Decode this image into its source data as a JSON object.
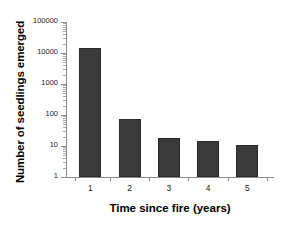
{
  "chart_data": {
    "type": "bar",
    "title": "",
    "xlabel": "Time since fire (years)",
    "ylabel": "Number of seedlings emerged",
    "categories": [
      "1",
      "2",
      "3",
      "4",
      "5"
    ],
    "values": [
      14000,
      75,
      18,
      14,
      11
    ],
    "yscale": "log",
    "ylim": [
      1,
      100000
    ],
    "yticks": [
      "1",
      "10",
      "100",
      "1000",
      "10000",
      "100000"
    ],
    "ytick_values": [
      1,
      10,
      100,
      1000,
      10000,
      100000
    ],
    "grid": false,
    "legend": null,
    "bar_color": "#3a3a3a",
    "axis_color": "#8a8a8a",
    "text_color": "#000000",
    "background": "#ffffff"
  }
}
